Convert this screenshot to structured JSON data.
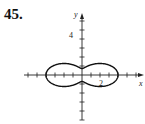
{
  "problem": {
    "number": "45."
  },
  "axes": {
    "x_label": "x",
    "y_label": "y",
    "x_tick_label": "2",
    "y_tick_label": "4",
    "origin_px": [
      82,
      75
    ],
    "unit_px": 9,
    "x_range": [
      -6,
      6.5
    ],
    "y_range": [
      -5,
      5.5
    ]
  },
  "curve": {
    "description": "Polar curve with two symmetric lobes left and right of the y-axis, touching the y-axis near (0, ±1.3)",
    "approx_polar": "r = 1 + 3cos^2(theta)",
    "x_extent": [
      -4.2,
      4.2
    ],
    "y_extent": [
      -2.8,
      2.8
    ],
    "color": "#111111"
  }
}
